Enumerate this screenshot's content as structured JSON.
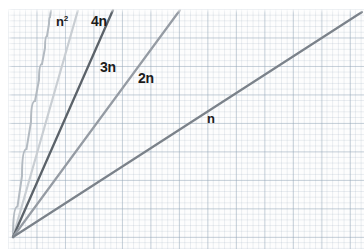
{
  "figure": {
    "background_color": "#ffffff",
    "grid_color": "#96a8b9",
    "label_color": "#1b1b1b"
  },
  "chart_data": {
    "type": "line",
    "title": "",
    "subtitle": "",
    "xlabel": "",
    "ylabel": "",
    "grid": true,
    "grid_style": "graph-paper",
    "legend": "inline-curve-labels",
    "axis_visible": false,
    "origin_px": [
      13,
      237
    ],
    "xlim": [
      0,
      1
    ],
    "ylim": [
      0,
      1
    ],
    "annotations": [
      {
        "text": "n²",
        "base": "n",
        "exponent": "2",
        "x_px": 56,
        "y_px": 15
      },
      {
        "text": "4n",
        "x_px": 91,
        "y_px": 14
      },
      {
        "text": "3n",
        "x_px": 100,
        "y_px": 60
      },
      {
        "text": "2n",
        "x_px": 138,
        "y_px": 71
      },
      {
        "text": "n",
        "x_px": 207,
        "y_px": 112
      }
    ],
    "series": [
      {
        "name": "n²",
        "label": "n²",
        "color": "#b3bac1",
        "width": 2.0,
        "shape": "curve",
        "points_px": [
          [
            13,
            237
          ],
          [
            22,
            176
          ],
          [
            31,
            122
          ],
          [
            39,
            80
          ],
          [
            45,
            48
          ],
          [
            49,
            24
          ],
          [
            51,
            10
          ]
        ],
        "end_px": [
          51,
          10
        ],
        "relative_slope": "steepest"
      },
      {
        "name": "4n",
        "label": "4n",
        "color": "#c9ced3",
        "width": 2.2,
        "shape": "line",
        "points_px": [
          [
            13,
            237
          ],
          [
            78,
            10
          ]
        ],
        "end_px": [
          78,
          10
        ],
        "slope_multiplier": 4
      },
      {
        "name": "3n",
        "label": "3n",
        "color": "#5b6269",
        "width": 2.3,
        "shape": "line",
        "points_px": [
          [
            13,
            237
          ],
          [
            113,
            10
          ]
        ],
        "end_px": [
          113,
          10
        ],
        "slope_multiplier": 3
      },
      {
        "name": "2n",
        "label": "2n",
        "color": "#959ba3",
        "width": 2.2,
        "shape": "line",
        "points_px": [
          [
            13,
            237
          ],
          [
            180,
            10
          ]
        ],
        "end_px": [
          180,
          10
        ],
        "slope_multiplier": 2
      },
      {
        "name": "n",
        "label": "n",
        "color": "#7b828a",
        "width": 2.2,
        "shape": "line",
        "points_px": [
          [
            13,
            237
          ],
          [
            362,
            12
          ]
        ],
        "end_px": [
          362,
          12
        ],
        "slope_multiplier": 1
      }
    ]
  }
}
